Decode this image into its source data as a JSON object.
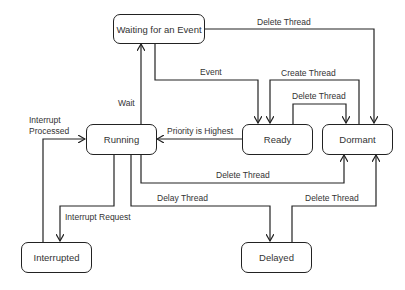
{
  "diagram": {
    "type": "state-transition",
    "states": [
      {
        "id": "waiting",
        "label": "Waiting for an Event"
      },
      {
        "id": "running",
        "label": "Running"
      },
      {
        "id": "ready",
        "label": "Ready"
      },
      {
        "id": "dormant",
        "label": "Dormant"
      },
      {
        "id": "interrupted",
        "label": "Interrupted"
      },
      {
        "id": "delayed",
        "label": "Delayed"
      }
    ],
    "transitions": [
      {
        "id": "wait",
        "from": "running",
        "to": "waiting",
        "label": "Wait"
      },
      {
        "id": "event",
        "from": "waiting",
        "to": "ready",
        "label": "Event"
      },
      {
        "id": "waiting_delete",
        "from": "waiting",
        "to": "dormant",
        "label": "Delete Thread"
      },
      {
        "id": "create",
        "from": "dormant",
        "to": "ready",
        "label": "Create Thread"
      },
      {
        "id": "ready_delete",
        "from": "ready",
        "to": "dormant",
        "label": "Delete Thread"
      },
      {
        "id": "priority",
        "from": "ready",
        "to": "running",
        "label": "Priority is Highest"
      },
      {
        "id": "running_delete",
        "from": "running",
        "to": "dormant",
        "label": "Delete Thread"
      },
      {
        "id": "delay",
        "from": "running",
        "to": "delayed",
        "label": "Delay Thread"
      },
      {
        "id": "delayed_delete",
        "from": "delayed",
        "to": "dormant",
        "label": "Delete Thread"
      },
      {
        "id": "int_request",
        "from": "running",
        "to": "interrupted",
        "label": "Interrupt Request"
      },
      {
        "id": "int_processed",
        "from": "interrupted",
        "to": "running",
        "label_line1": "Interrupt",
        "label_line2": "Processed"
      }
    ],
    "colors": {
      "stroke": "#222222",
      "text": "#333333",
      "background": "#ffffff"
    }
  }
}
